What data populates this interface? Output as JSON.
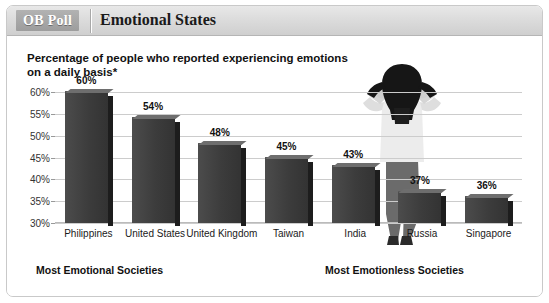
{
  "header": {
    "badge": "OB Poll",
    "title": "Emotional States"
  },
  "subtitle": "Percentage of people who reported experiencing emotions on a daily basis*",
  "footnotes": {
    "left": "Most Emotional Societies",
    "right": "Most Emotionless Societies"
  },
  "figure": {
    "name": "person-hands-on-head-illustration",
    "hair_color": "#1a1a1a",
    "shirt_color": "#e6e6e6",
    "pants_color": "#6b6b6b",
    "skin_color": "#d8d8d8"
  },
  "colors": {
    "bar_front": "#3c3c3c",
    "bar_side": "#1d1d1d",
    "bar_top": "#6e6e6e",
    "gridline": "#cccccc",
    "header_bg": "#dcdcdc",
    "badge_bg": "#a5a5a5",
    "frame_border": "#c9c9c9"
  },
  "chart_data": {
    "type": "bar",
    "title": "Emotional States",
    "subtitle": "Percentage of people who reported experiencing emotions on a daily basis*",
    "xlabel": "",
    "ylabel": "",
    "categories": [
      "Philippines",
      "United States",
      "United Kingdom",
      "Taiwan",
      "India",
      "Russia",
      "Singapore"
    ],
    "values": [
      60,
      54,
      48,
      45,
      43,
      37,
      36
    ],
    "data_labels": [
      "60%",
      "54%",
      "48%",
      "45%",
      "43%",
      "37%",
      "36%"
    ],
    "ylim": [
      30,
      60
    ],
    "yticks": [
      30,
      35,
      40,
      45,
      50,
      55,
      60
    ],
    "ytick_labels": [
      "30%",
      "35%",
      "40%",
      "45%",
      "50%",
      "55%",
      "60%"
    ],
    "grid": true,
    "legend": false,
    "annotations": [
      "Most Emotional Societies",
      "Most Emotionless Societies"
    ]
  }
}
